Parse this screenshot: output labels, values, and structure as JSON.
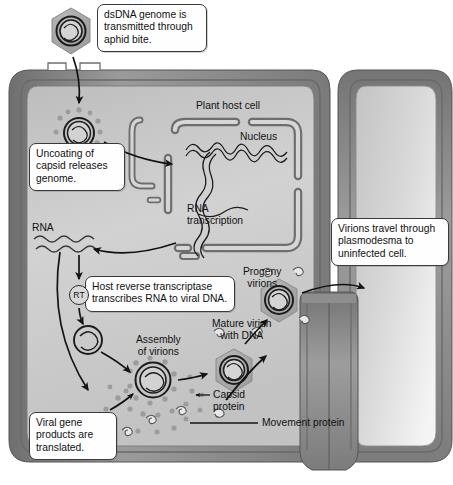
{
  "figure": {
    "type": "biology-process-diagram"
  },
  "callouts": [
    {
      "id": "aphid",
      "text": "dsDNA genome is transmitted through aphid bite."
    },
    {
      "id": "uncoating",
      "text": "Uncoating of capsid releases genome."
    },
    {
      "id": "rt",
      "text": "Host reverse transcriptase transcribes RNA to viral DNA."
    },
    {
      "id": "translation",
      "text": "Viral gene products are translated."
    },
    {
      "id": "plasmodesma",
      "text": "Virions travel through plasmodesma to uninfected cell."
    }
  ],
  "labels": {
    "plant_host_cell": "Plant host cell",
    "nucleus": "Nucleus",
    "rna_transcription": "RNA\ntranscription",
    "rna": "RNA",
    "assembly": "Assembly\nof virions",
    "mature_virion": "Mature virion\nwith DNA",
    "progeny": "Progeny\nvirions",
    "capsid_protein": "Capsid\nprotein",
    "movement_protein": "Movement protein",
    "rt_enzyme": "RT"
  },
  "colors": {
    "ink": "#111111",
    "outline": "#2b2b2b",
    "cell_wall": "#8c8c8c",
    "cytoplasm": "#cdcdcd",
    "capsid_grey": "#a8a8a8",
    "callout_fill": "#fefefe",
    "background": "#ffffff"
  }
}
